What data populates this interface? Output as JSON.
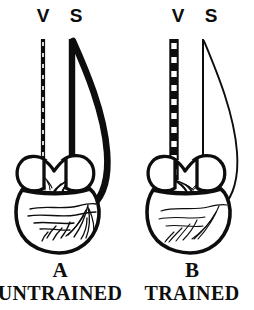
{
  "figure": {
    "background_color": "#ffffff",
    "ink_color": "#0d0d0d",
    "panels": [
      {
        "id": "untrained",
        "letter": "A",
        "caption": "UNTRAINED",
        "nerves": [
          {
            "id": "vagus",
            "label": "V",
            "name": "vagus-nerve",
            "style": "dashed",
            "thickness": "thin",
            "terminal_branching": "sparse"
          },
          {
            "id": "sympathetic",
            "label": "S",
            "name": "sympathetic-nerve",
            "style": "solid",
            "thickness": "thick",
            "terminal_branching": "dense"
          }
        ],
        "heart": {
          "atria": "two-lobed",
          "ventricle": "rounded",
          "ventricle_innervation": "dense"
        }
      },
      {
        "id": "trained",
        "letter": "B",
        "caption": "TRAINED",
        "nerves": [
          {
            "id": "vagus",
            "label": "V",
            "name": "vagus-nerve",
            "style": "dashed",
            "thickness": "thick",
            "terminal_branching": "dense"
          },
          {
            "id": "sympathetic",
            "label": "S",
            "name": "sympathetic-nerve",
            "style": "solid",
            "thickness": "thin",
            "terminal_branching": "sparse"
          }
        ],
        "heart": {
          "atria": "two-lobed",
          "ventricle": "rounded",
          "ventricle_innervation": "sparse"
        }
      }
    ]
  }
}
